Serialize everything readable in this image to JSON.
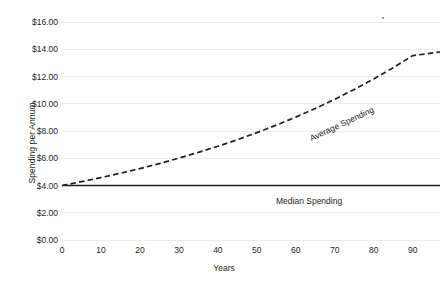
{
  "chart_data": {
    "type": "line",
    "title": "",
    "xlabel": "Years",
    "ylabel": "Spending per Annum",
    "xlim": [
      0,
      97
    ],
    "ylim": [
      0,
      16
    ],
    "grid": true,
    "grid_axis": "y",
    "legend": "inline-annotations",
    "x_ticks": [
      0,
      10,
      20,
      30,
      40,
      50,
      60,
      70,
      80,
      90
    ],
    "x_tick_labels": [
      "0",
      "10",
      "20",
      "30",
      "40",
      "50",
      "60",
      "70",
      "80",
      "90"
    ],
    "y_ticks": [
      0,
      2,
      4,
      6,
      8,
      10,
      12,
      14,
      16
    ],
    "y_tick_labels": [
      "$0.00",
      "$2.00",
      "$4.00",
      "$6.00",
      "$8.00",
      "$10.00",
      "$12.00",
      "$14.00",
      "$16.00"
    ],
    "x": [
      0,
      5,
      10,
      15,
      20,
      25,
      30,
      35,
      40,
      45,
      50,
      55,
      60,
      65,
      70,
      75,
      80,
      85,
      90,
      97
    ],
    "series": [
      {
        "name": "Average Spending",
        "style": "dashed",
        "color": "#231f20",
        "values": [
          4.0,
          4.28,
          4.58,
          4.9,
          5.24,
          5.61,
          6.01,
          6.43,
          6.88,
          7.36,
          7.88,
          8.43,
          9.02,
          9.65,
          10.33,
          11.05,
          11.82,
          12.65,
          13.53,
          13.8
        ]
      },
      {
        "name": "Median Spending",
        "style": "solid",
        "color": "#231f20",
        "values": [
          4.0,
          4.0,
          4.0,
          4.0,
          4.0,
          4.0,
          4.0,
          4.0,
          4.0,
          4.0,
          4.0,
          4.0,
          4.0,
          4.0,
          4.0,
          4.0,
          4.0,
          4.0,
          4.0,
          4.0
        ]
      }
    ],
    "annotations": [
      {
        "text": "Average Spending",
        "rotated": true
      },
      {
        "text": "Median Spending",
        "rotated": false
      }
    ]
  },
  "colors": {
    "ink": "#231f20",
    "gridline": "#ececed",
    "background": "#ffffff"
  }
}
